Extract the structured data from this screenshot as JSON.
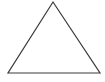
{
  "figure": {
    "shape": "triangle",
    "stroke_color": "#3a3a3a",
    "fill_color": "#ffffff",
    "background": "#ffffff",
    "vertices": {
      "apex": [
        53,
        2
      ],
      "bottom_left": [
        8,
        73
      ],
      "bottom_right": [
        100,
        73
      ]
    }
  }
}
